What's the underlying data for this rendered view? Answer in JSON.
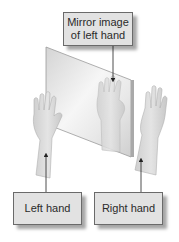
{
  "diagram": {
    "labels": {
      "mirror_image_line1": "Mirror image",
      "mirror_image_line2": "of left hand",
      "left_hand": "Left hand",
      "right_hand": "Right hand"
    },
    "elements": [
      {
        "id": "mirror",
        "description": "Tilted flat mirror panel"
      },
      {
        "id": "left-hand",
        "description": "Left hand raised, palm facing mirror"
      },
      {
        "id": "mirror-reflection",
        "description": "Reflection of left hand inside mirror"
      },
      {
        "id": "right-hand",
        "description": "Right hand raised, palm facing viewer"
      }
    ],
    "arrows": [
      {
        "from": "Mirror image of left hand",
        "to": "mirror-reflection"
      },
      {
        "from": "Left hand",
        "to": "left-hand"
      },
      {
        "from": "Right hand",
        "to": "right-hand"
      }
    ],
    "colors": {
      "box_fill": "#e2e2e2",
      "box_border": "#6a6a6a",
      "hand_fill": "#d9d9d9",
      "mirror_edge": "#9a9a9a",
      "arrow": "#222222"
    }
  }
}
